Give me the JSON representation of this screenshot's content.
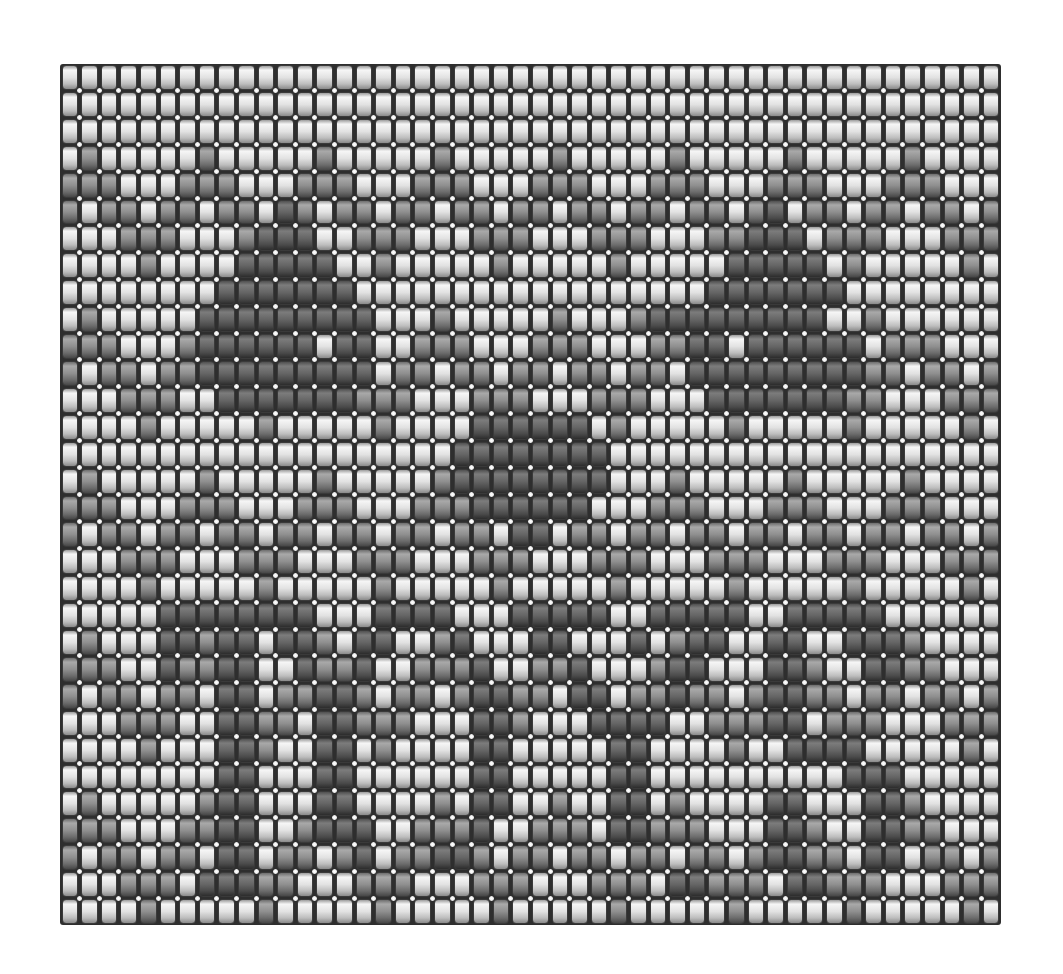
{
  "pattern": {
    "title": "",
    "columns": 48,
    "rows_count": 32,
    "shade_legend": {
      "L": "light bead",
      "M": "medium bead",
      "D": "dark bead"
    },
    "colors": {
      "L": "#e2e2e2",
      "M": "#8f8f8f",
      "D": "#656565",
      "grout": "#2e2e2e",
      "junction_dot": "#ffffff"
    },
    "rows": [
      "LLLLLLLLLLLLLLLLLLLLLLLLLLLLLLLLLLLLLLLLLLLLLLLL",
      "LLLLLLLLLLLLLLLLLLLLLLLLLLLLLLLLLLLLLLLLLLLLLLLL",
      "LLLLLLLLLLLLLLLLLLLLLLLLLLLLLLLLLLLLLLLLLLLLLLLL",
      "LMLLLLLMLLLLLMLLLLLMLLLLLMLLLLLMLLLLLMLLLLLMLLLL",
      "MMMLLLMMMLLLMMMLLLMMMLLLMMMLLLMMMLLLMMMLLLMMMLLL",
      "MLMMLMMLMMLDMLMMLMMLMMLMMLMMLMMLMMLMDLMMLMMLMMLM",
      "LLLMMMLLLMDDDLLMMMLLLMMMLLLMMMLLLMMDDDLMMMLLLMMM",
      "LLLLMLLLLDDDDDLLMLLLLLMLLLLLMLLLLLDDDDDLMLLLLLML",
      "LLLLLLLLDDDDDDDLLLLLLLLLLLLLLLLLLDDDDDDDLLLLLLLL",
      "LMLLLLLDDDDDDDDDLLLMLLLLLMLLLMDDDDDDDDDLLMLLLL",
      "MMMLLLMDDDDDDLDDLLMMMLLLMMMLLLMMDDLDDDDDDLMMMLLL",
      "MLMMLMMDDDDDDDDDLMMLMMLMMLMMLMMLDDDDDDDDDMMLMMLM",
      "LLLMMMLLDDDDDDDMMMLLLMMMLLLMMMLLLDDDDDDDMMLLLMMM",
      "LLLLMLLLLLMLLLLLMLLLLDDDDDDLMLLLLLMLLLLLMLLLLLML",
      "LLLLLLLLLLLLLLLLLLLLDDDDDDDDLLLLLLLLLLLLLLLLLLLL",
      "LMLLLLLMLLLLLMLLLLLMDDDDDDDDLLLMLLLLLMLLLLLMLLLL",
      "MMMLLLMMMLLLMMMLLLMMMDDDDDDLLLMMMLLLMMMLLLMMMLLL",
      "MLMMLMMLMMLMMLMMLMMLMMLDDLMMLMMLMMLMMLMMLMMLMMLM",
      "LLLMMMLLLMMMLLLMMMLLLMMMLLLMMMLLLMMMLLLMMMLLLMMM",
      "LLLLMLLLLLMLLLLLMLLLLLMLLLLLMLLLLLMLLLLLMLLLLLML",
      "LLLLLDDDDDDDDLLLDDDDLLLDDDDDLLDDDDDLLDDDDDLLLLLL",
      "LMLLLDDMDDLDDMLDDLLMDLLLDDLLLDLMDDLLDDLLDDDMLLLL",
      "MMMLLDMMDDLLDMMDLLMMMDLLMMDLLLMDDLLLDDMLLDDMMLLL",
      "MLMMLMMLDDLMMDDMLMMLMDDMMLDDLMMDMMLMDDMMLMMLMMLM",
      "LLLMMMLLDDMMLDDMMMLLLDDMLLLDDDDLLMMMDDLMMMLLLMMM",
      "LLLLMLLLDDMLLDDLMLLLLDDLLLLLDDLLLLMLLDDDDLLLLLML",
      "LLLLLLLLDDLLLDDLLLLLLDDLLLLLDDLLLLLLLLLLDDDLLLLL",
      "LMLLLLLMDDLLLDDLLLLMLDDLLMLLDDLMLLLLDDLLLDDMLLLL",
      "MMMLLLMMDDLLMDDDLLMMMDLLMMMLDDMMMLLLDDMLLDDMMLLL",
      "MLMMLMMLDDLMMLMDLMMDDMLMMLMMLMMLMMLMDDMMLDDLMMLM",
      "LLLMMMLDDDMMLLLMMMLLLMMMLLLMMMLDDMMMLDDMMMLLLMMM",
      "LLLLMLLLLLMLLLLLMLLLLLMLLLLLMLLLLLMLLLLLMLLLLLML"
    ]
  }
}
